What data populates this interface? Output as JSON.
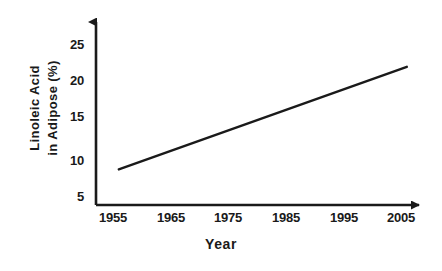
{
  "chart_data": {
    "type": "line",
    "title": "",
    "subtitle": "",
    "xlabel": "Year",
    "ylabel": "Linoleic Acid in Adipose (%)",
    "ylabel_line1": "Linoleic Acid",
    "ylabel_line2": "in Adipose (%)",
    "x": [
      1956,
      2006
    ],
    "series": [
      {
        "name": "Linoleic Acid in Adipose",
        "values": [
          8.5,
          22.0
        ],
        "color": "#1a1a1a"
      }
    ],
    "xlim": [
      1950,
      2010
    ],
    "ylim": [
      3.5,
      27.5
    ],
    "xticks": [
      1955,
      1965,
      1975,
      1985,
      1995,
      2005
    ],
    "xtick_labels": [
      "1955",
      "1965",
      "1975",
      "1985",
      "1995",
      "2005"
    ],
    "yticks": [
      5,
      10,
      15,
      20,
      25
    ],
    "ytick_labels": [
      "5",
      "10",
      "15",
      "20",
      "25"
    ],
    "grid": false,
    "legend": false,
    "legend_position": "none",
    "annotations": [],
    "axis_arrows": true,
    "background_color": "#ffffff",
    "axis_color": "#1a1a1a",
    "line_color": "#1a1a1a"
  }
}
